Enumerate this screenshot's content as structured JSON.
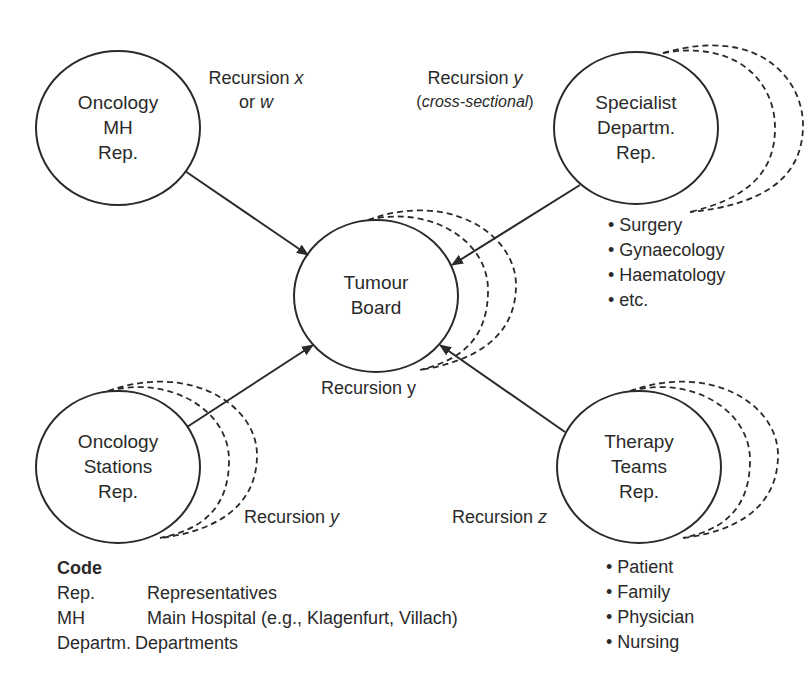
{
  "diagram": {
    "nodes": {
      "oncology_mh": {
        "lines": [
          "Oncology",
          "MH",
          "Rep."
        ],
        "cx": 118,
        "cy": 128,
        "rx": 82,
        "ry": 77,
        "stacked": false
      },
      "specialist": {
        "lines": [
          "Specialist",
          "Departm.",
          "Rep."
        ],
        "cx": 636,
        "cy": 128,
        "rx": 82,
        "ry": 76,
        "stacked": true
      },
      "tumour_board": {
        "lines": [
          "Tumour",
          "Board"
        ],
        "cx": 376,
        "cy": 296,
        "rx": 82,
        "ry": 76,
        "stacked": true
      },
      "oncology_stations": {
        "lines": [
          "Oncology",
          "Stations",
          "Rep."
        ],
        "cx": 118,
        "cy": 467,
        "rx": 82,
        "ry": 76,
        "stacked": true
      },
      "therapy_teams": {
        "lines": [
          "Therapy",
          "Teams",
          "Rep."
        ],
        "cx": 639,
        "cy": 467,
        "rx": 82,
        "ry": 76,
        "stacked": true
      }
    },
    "edges": [
      {
        "from": "oncology_mh",
        "to": "tumour_board",
        "x1": 185,
        "y1": 171,
        "x2": 308,
        "y2": 255
      },
      {
        "from": "specialist",
        "to": "tumour_board",
        "x1": 580,
        "y1": 185,
        "x2": 452,
        "y2": 265
      },
      {
        "from": "oncology_stations",
        "to": "tumour_board",
        "x1": 187,
        "y1": 427,
        "x2": 313,
        "y2": 345
      },
      {
        "from": "therapy_teams",
        "to": "tumour_board",
        "x1": 565,
        "y1": 432,
        "x2": 440,
        "y2": 345
      }
    ],
    "annotations": {
      "recursion_xw": {
        "line1_prefix": "Recursion ",
        "line1_var": "x",
        "line2_prefix": "or ",
        "line2_var": "w"
      },
      "recursion_y_cross": {
        "line1_prefix": "Recursion ",
        "line1_var": "y",
        "line2_open": "(",
        "line2_italic": "cross-sectional",
        "line2_close": ")"
      },
      "recursion_y_board": {
        "text": "Recursion y"
      },
      "recursion_y_stations": {
        "prefix": "Recursion ",
        "var": "y"
      },
      "recursion_z_therapy": {
        "prefix": "Recursion ",
        "var": "z"
      }
    },
    "specialist_list": [
      "Surgery",
      "Gynaecology",
      "Haematology",
      "etc."
    ],
    "therapy_list": [
      "Patient",
      "Family",
      "Physician",
      "Nursing"
    ],
    "legend": {
      "title": "Code",
      "rows": [
        {
          "abbr": "Rep.",
          "meaning": "Representatives"
        },
        {
          "abbr": "MH",
          "meaning": "Main Hospital (e.g., Klagenfurt, Villach)"
        },
        {
          "abbr": "Departm.",
          "meaning": "Departments"
        }
      ]
    },
    "colors": {
      "stroke": "#2a2a2a",
      "background": "#ffffff"
    }
  }
}
